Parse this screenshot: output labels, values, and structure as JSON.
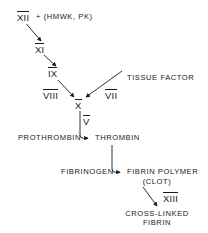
{
  "diagram": {
    "nodes": {
      "factor_xii": "XII",
      "cofactors": "+ (HMWK, PK)",
      "factor_xi": "XI",
      "factor_ix": "IX",
      "factor_viii": "VIII",
      "factor_x": "X",
      "factor_vii": "VII",
      "tissue_factor": "TISSUE FACTOR",
      "factor_v": "V",
      "prothrombin": "PROTHROMBIN",
      "thrombin": "THROMBIN",
      "fibrinogen": "FIBRINOGEN",
      "fibrin_polymer": "FIBRIN POLYMER",
      "clot": "(CLOT)",
      "factor_xiii": "XIII",
      "cross_linked_1": "CROSS-LINKED",
      "cross_linked_2": "FIBRIN"
    },
    "colors": {
      "ink": "#1a1a1a",
      "background": "#ffffff"
    }
  }
}
